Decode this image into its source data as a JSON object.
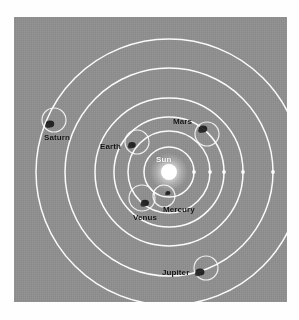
{
  "figure": {
    "plate_color": "#8e8e8e",
    "orbit_color": "#ffffff",
    "label_color": "#111111",
    "sun_color": "#ffffff",
    "center": {
      "x": 155,
      "y": 155
    }
  },
  "center_body": {
    "name": "Sun",
    "label": "Sun",
    "label_x": 142,
    "label_y": 139,
    "cx": 155,
    "cy": 155,
    "radius": 8,
    "glow_radius": 19
  },
  "orbits": [
    {
      "name": "mercury-orbit",
      "rx": 25,
      "ry": 25
    },
    {
      "name": "venus-orbit",
      "rx": 41,
      "ry": 41
    },
    {
      "name": "earth-orbit",
      "rx": 55,
      "ry": 55
    },
    {
      "name": "mars-orbit",
      "rx": 74,
      "ry": 74
    },
    {
      "name": "jupiter-orbit",
      "rx": 104,
      "ry": 104
    },
    {
      "name": "saturn-orbit",
      "rx": 133,
      "ry": 133
    }
  ],
  "planets": [
    {
      "name": "Mercury",
      "label": "Mercury",
      "label_x": 149,
      "label_y": 189,
      "body_cx": 154,
      "body_cy": 176,
      "body_r": 2.0,
      "epicycle_cx": 150,
      "epicycle_cy": 179,
      "epicycle_r": 11
    },
    {
      "name": "Venus",
      "label": "Venus",
      "label_x": 119,
      "label_y": 197,
      "body_cx": 131,
      "body_cy": 186,
      "body_r": 3.2,
      "epicycle_cx": 128,
      "epicycle_cy": 181,
      "epicycle_r": 13
    },
    {
      "name": "Earth",
      "label": "Earth",
      "label_x": 86,
      "label_y": 126,
      "body_cx": 118,
      "body_cy": 128,
      "body_r": 3.0,
      "epicycle_cx": 123,
      "epicycle_cy": 125,
      "epicycle_r": 12
    },
    {
      "name": "Mars",
      "label": "Mars",
      "label_x": 159,
      "label_y": 101,
      "body_cx": 189,
      "body_cy": 112,
      "body_r": 3.4,
      "epicycle_cx": 193,
      "epicycle_cy": 117,
      "epicycle_r": 12
    },
    {
      "name": "Jupiter",
      "label": "Jupiter",
      "label_x": 148,
      "label_y": 252,
      "body_cx": 186,
      "body_cy": 255,
      "body_r": 3.6,
      "epicycle_cx": 192,
      "epicycle_cy": 251,
      "epicycle_r": 12
    },
    {
      "name": "Saturn",
      "label": "Saturn",
      "label_x": 30,
      "label_y": 117,
      "body_cx": 36,
      "body_cy": 107,
      "body_r": 3.4,
      "epicycle_cx": 40,
      "epicycle_cy": 103,
      "epicycle_r": 12
    }
  ],
  "node_markers": [
    {
      "name": "mercury-node",
      "cx": 180,
      "cy": 155
    },
    {
      "name": "venus-node",
      "cx": 196,
      "cy": 155
    },
    {
      "name": "earth-node",
      "cx": 210,
      "cy": 155
    },
    {
      "name": "mars-node",
      "cx": 229,
      "cy": 155
    },
    {
      "name": "jupiter-node",
      "cx": 259,
      "cy": 155
    }
  ]
}
